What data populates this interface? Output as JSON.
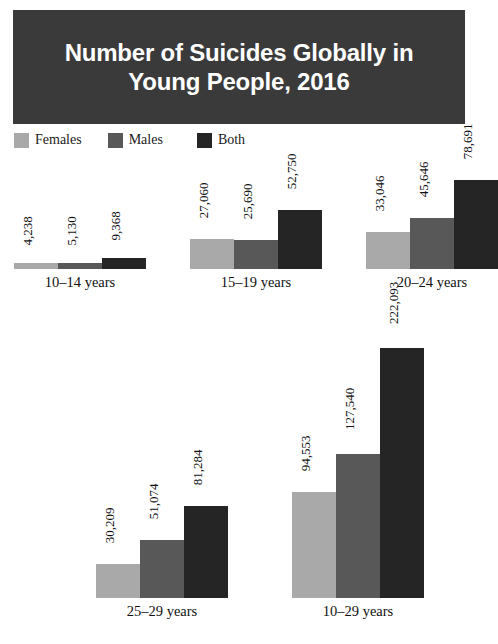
{
  "title": {
    "text": "Number of Suicides Globally in\nYoung People, 2016",
    "background_color": "#3a3a3a",
    "text_color": "#ffffff"
  },
  "legend": {
    "position": "top-left",
    "entries": [
      {
        "label": "Females",
        "color": "#a9a9a9",
        "icon": "color-swatch"
      },
      {
        "label": "Males",
        "color": "#585858",
        "icon": "color-swatch"
      },
      {
        "label": "Both",
        "color": "#252525",
        "icon": "color-swatch"
      }
    ]
  },
  "chart_data": {
    "type": "bar",
    "title": "Number of Suicides Globally in Young People, 2016",
    "xlabel": "",
    "ylabel": "",
    "grid": false,
    "legend_position": "top-left",
    "axis_visible": false,
    "value_labels_rotated": true,
    "categories": [
      "10–14 years",
      "15–19 years",
      "20–24 years",
      "25–29 years",
      "10–29 years"
    ],
    "series": [
      {
        "name": "Females",
        "color": "#a9a9a9",
        "values": [
          4238,
          27060,
          33046,
          30209,
          94553
        ]
      },
      {
        "name": "Males",
        "color": "#585858",
        "values": [
          5130,
          25690,
          45646,
          51074,
          127540
        ]
      },
      {
        "name": "Both",
        "color": "#252525",
        "values": [
          9368,
          52750,
          78691,
          81284,
          222093
        ]
      }
    ],
    "value_labels": [
      [
        "4,238",
        "5,130",
        "9,368"
      ],
      [
        "27,060",
        "25,690",
        "52,750"
      ],
      [
        "33,046",
        "45,646",
        "78,691"
      ],
      [
        "30,209",
        "51,074",
        "81,284"
      ],
      [
        "94,553",
        "127,540",
        "222,093"
      ]
    ],
    "ylim": [
      0,
      222093
    ]
  },
  "groups": [
    {
      "label": "10–14 years",
      "bars": [
        {
          "series": "Females",
          "value": 4238,
          "label": "4,238",
          "color": "#a9a9a9"
        },
        {
          "series": "Males",
          "value": 5130,
          "label": "5,130",
          "color": "#585858"
        },
        {
          "series": "Both",
          "value": 9368,
          "label": "9,368",
          "color": "#252525"
        }
      ]
    },
    {
      "label": "15–19 years",
      "bars": [
        {
          "series": "Females",
          "value": 27060,
          "label": "27,060",
          "color": "#a9a9a9"
        },
        {
          "series": "Males",
          "value": 25690,
          "label": "25,690",
          "color": "#585858"
        },
        {
          "series": "Both",
          "value": 52750,
          "label": "52,750",
          "color": "#252525"
        }
      ]
    },
    {
      "label": "20–24 years",
      "bars": [
        {
          "series": "Females",
          "value": 33046,
          "label": "33,046",
          "color": "#a9a9a9"
        },
        {
          "series": "Males",
          "value": 45646,
          "label": "45,646",
          "color": "#585858"
        },
        {
          "series": "Both",
          "value": 78691,
          "label": "78,691",
          "color": "#252525"
        }
      ]
    },
    {
      "label": "25–29 years",
      "bars": [
        {
          "series": "Females",
          "value": 30209,
          "label": "30,209",
          "color": "#a9a9a9"
        },
        {
          "series": "Males",
          "value": 51074,
          "label": "51,074",
          "color": "#585858"
        },
        {
          "series": "Both",
          "value": 81284,
          "label": "81,284",
          "color": "#252525"
        }
      ]
    },
    {
      "label": "10–29 years",
      "bars": [
        {
          "series": "Females",
          "value": 94553,
          "label": "94,553",
          "color": "#a9a9a9"
        },
        {
          "series": "Males",
          "value": 127540,
          "label": "127,540",
          "color": "#585858"
        },
        {
          "series": "Both",
          "value": 222093,
          "label": "222,093",
          "color": "#252525"
        }
      ]
    }
  ],
  "layout": {
    "rows": [
      {
        "group_indexes": [
          0,
          1,
          2
        ],
        "baseline_y": 291,
        "left": 14,
        "gap": 44
      },
      {
        "group_indexes": [
          3,
          4
        ],
        "baseline_y": 620,
        "left": 96,
        "gap": 64
      }
    ],
    "bar_width": 44,
    "max_bar_height": 250,
    "scale_value_per_px": 888
  }
}
